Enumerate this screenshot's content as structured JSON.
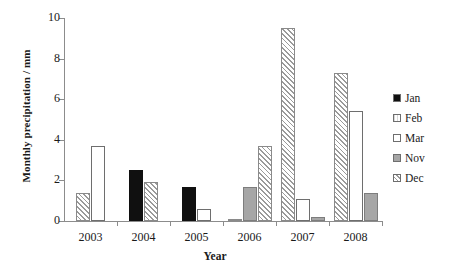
{
  "chart_data": {
    "type": "bar",
    "title": "",
    "xlabel": "Year",
    "ylabel": "Monthly precipitation / mm",
    "categories": [
      "2003",
      "2004",
      "2005",
      "2006",
      "2007",
      "2008"
    ],
    "ylim": [
      0,
      10
    ],
    "yticks": [
      "0",
      "2",
      "4",
      "6",
      "8",
      "10"
    ],
    "grid": false,
    "legend_position": "right",
    "series": [
      {
        "name": "Jan",
        "pattern": "solid-black",
        "values": [
          null,
          2.5,
          1.7,
          null,
          null,
          null
        ]
      },
      {
        "name": "Feb",
        "pattern": "light-dotted",
        "values": [
          null,
          null,
          null,
          0.1,
          null,
          null
        ]
      },
      {
        "name": "Mar",
        "pattern": "white-open",
        "values": [
          3.7,
          null,
          0.6,
          null,
          1.1,
          5.4
        ]
      },
      {
        "name": "Nov",
        "pattern": "gray-fill",
        "values": [
          null,
          null,
          null,
          1.7,
          0.2,
          1.4
        ]
      },
      {
        "name": "Dec",
        "pattern": "diagonal-hatch",
        "values": [
          1.4,
          1.9,
          null,
          3.7,
          9.5,
          7.3
        ]
      }
    ],
    "bars": [
      {
        "year": "2003",
        "month": "Dec",
        "value": 1.4,
        "pattern": "dec"
      },
      {
        "year": "2003",
        "month": "Mar",
        "value": 3.7,
        "pattern": "mar"
      },
      {
        "year": "2004",
        "month": "Jan",
        "value": 2.5,
        "pattern": "jan"
      },
      {
        "year": "2004",
        "month": "Dec",
        "value": 1.9,
        "pattern": "dec"
      },
      {
        "year": "2005",
        "month": "Jan",
        "value": 1.7,
        "pattern": "jan"
      },
      {
        "year": "2005",
        "month": "Mar",
        "value": 0.6,
        "pattern": "mar"
      },
      {
        "year": "2006",
        "month": "Feb",
        "value": 0.1,
        "pattern": "feb"
      },
      {
        "year": "2006",
        "month": "Nov",
        "value": 1.7,
        "pattern": "nov"
      },
      {
        "year": "2006",
        "month": "Dec",
        "value": 3.7,
        "pattern": "dec"
      },
      {
        "year": "2007",
        "month": "Dec",
        "value": 9.5,
        "pattern": "dec"
      },
      {
        "year": "2007",
        "month": "Mar",
        "value": 1.1,
        "pattern": "mar"
      },
      {
        "year": "2007",
        "month": "Nov",
        "value": 0.2,
        "pattern": "nov"
      },
      {
        "year": "2008",
        "month": "Dec",
        "value": 7.3,
        "pattern": "dec"
      },
      {
        "year": "2008",
        "month": "Mar",
        "value": 5.4,
        "pattern": "mar"
      },
      {
        "year": "2008",
        "month": "Nov",
        "value": 1.4,
        "pattern": "nov"
      }
    ]
  },
  "legend": {
    "items": [
      {
        "label": "Jan",
        "pattern": "jan"
      },
      {
        "label": "Feb",
        "pattern": "feb"
      },
      {
        "label": "Mar",
        "pattern": "mar"
      },
      {
        "label": "Nov",
        "pattern": "nov"
      },
      {
        "label": "Dec",
        "pattern": "dec"
      }
    ]
  }
}
